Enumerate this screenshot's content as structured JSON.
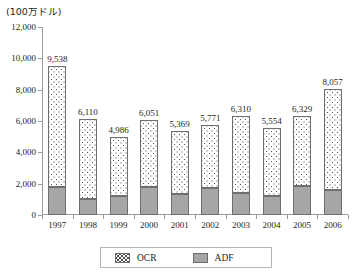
{
  "unit_label": "(100万ドル)",
  "chart_data": {
    "type": "bar",
    "subtype": "stacked-column",
    "title": "",
    "subtitle": "",
    "xlabel": "",
    "ylabel": "(100万ドル)",
    "ylim": [
      0,
      12000
    ],
    "ytick_step": 2000,
    "ytick_labels": [
      "12,000",
      "10,000",
      "8,000",
      "6,000",
      "4,000",
      "2,000",
      "0"
    ],
    "ytick_values": [
      12000,
      10000,
      8000,
      6000,
      4000,
      2000,
      0
    ],
    "grid": false,
    "legend_position": "bottom",
    "categories": [
      "1997",
      "1998",
      "1999",
      "2000",
      "2001",
      "2002",
      "2003",
      "2004",
      "2005",
      "2006"
    ],
    "series": [
      {
        "name": "ADF",
        "color": "#a6a6a6",
        "pattern": "solid",
        "values": [
          1800,
          1000,
          1200,
          1800,
          1350,
          1750,
          1400,
          1200,
          1850,
          1600
        ]
      },
      {
        "name": "OCR",
        "color": "#ffffff",
        "pattern": "dotted-checker",
        "values": [
          7738,
          5110,
          3786,
          4251,
          4019,
          4021,
          4910,
          4354,
          4479,
          6457
        ]
      }
    ],
    "totals": [
      9538,
      6110,
      4986,
      6051,
      5369,
      5771,
      6310,
      5554,
      6329,
      8057
    ],
    "total_labels": [
      "9,538",
      "6,110",
      "4,986",
      "6,051",
      "5,369",
      "5,771",
      "6,310",
      "5,554",
      "6,329",
      "8,057"
    ]
  },
  "legend": {
    "items": [
      {
        "label": "OCR",
        "swatch": "dotted-checker-swatch"
      },
      {
        "label": "ADF",
        "swatch": "solid-gray-swatch"
      }
    ]
  }
}
